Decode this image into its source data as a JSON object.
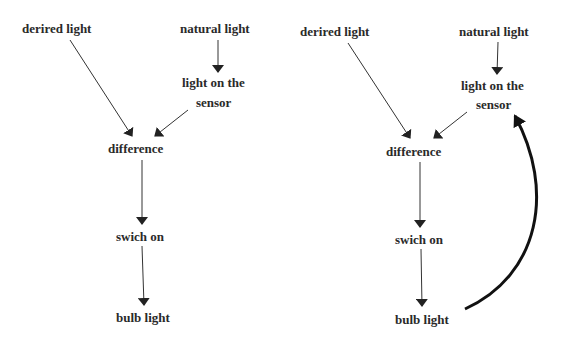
{
  "diagrams": [
    {
      "name": "open-loop",
      "nodes": {
        "desired": "derired light",
        "natural": "natural light",
        "sensor_line1": "light on the",
        "sensor_line2": "sensor",
        "difference": "difference",
        "switch": "swich on",
        "bulb": "bulb light"
      }
    },
    {
      "name": "closed-loop",
      "nodes": {
        "desired": "derired light",
        "natural": "natural light",
        "sensor_line1": "light on the",
        "sensor_line2": "sensor",
        "difference": "difference",
        "switch": "swich on",
        "bulb": "bulb light"
      },
      "feedback": "bulb light -> light on the sensor"
    }
  ],
  "colors": {
    "text": "#2a2a2a",
    "line": "#333333",
    "feedback": "#111111"
  }
}
